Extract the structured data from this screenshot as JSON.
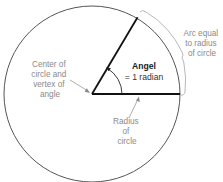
{
  "diagram": {
    "labels": {
      "center": [
        "Center of",
        "circle and",
        "vertex of",
        "angle"
      ],
      "angle_line1": "Angel",
      "angle_line2": "= 1 radian",
      "arc": [
        "Arc equal",
        "to radius",
        "of circle"
      ],
      "radius": [
        "Radius",
        "of",
        "circle"
      ]
    },
    "colors": {
      "circle": "#555555",
      "radius_lines": "#111111",
      "label_text": "#8a8a8a",
      "angle_text": "#1a1a1a",
      "brace": "#b0b0b0"
    }
  }
}
